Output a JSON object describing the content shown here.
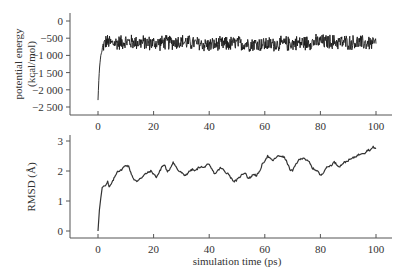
{
  "chart_data": [
    {
      "type": "line",
      "title": "",
      "xlabel": "",
      "ylabel": "potential energy (kcal/mol)",
      "ylabel_lines": [
        "potential energy",
        "(kcal/mol)"
      ],
      "xlim": [
        -10,
        105
      ],
      "ylim": [
        -2700,
        250
      ],
      "x_ticks": [
        0,
        20,
        40,
        60,
        80,
        100
      ],
      "x_tick_labels": [
        "0",
        "20",
        "40",
        "60",
        "80",
        "100"
      ],
      "y_ticks": [
        0,
        -500,
        -1000,
        -1500,
        -2000,
        -2500
      ],
      "y_tick_labels": [
        "0",
        "-500",
        "-1 000",
        "-1 500",
        "-2 000",
        "-2 500"
      ],
      "grid": false,
      "series": [
        {
          "name": "potential energy",
          "color": "#1a1a1a",
          "description": "Starts at about -2300 at t=0, rises sharply to about -700 by t=2 ps, then fluctuates noisily around -650 (range approx -1200 to -50) until 100 ps",
          "x": [
            0,
            0.3,
            0.6,
            1,
            1.5,
            2,
            3,
            5,
            10,
            20,
            30,
            40,
            50,
            60,
            70,
            80,
            90,
            100
          ],
          "values": [
            -2300,
            -1700,
            -1300,
            -1000,
            -850,
            -700,
            -600,
            -650,
            -600,
            -650,
            -600,
            -700,
            -650,
            -680,
            -650,
            -600,
            -620,
            -650
          ],
          "noise_amplitude": 250
        }
      ]
    },
    {
      "type": "line",
      "title": "",
      "xlabel": "simulation time (ps)",
      "ylabel": "RMSD (Å)",
      "xlim": [
        -10,
        105
      ],
      "ylim": [
        -0.25,
        3.2
      ],
      "x_ticks": [
        0,
        20,
        40,
        60,
        80,
        100
      ],
      "x_tick_labels": [
        "0",
        "20",
        "40",
        "60",
        "80",
        "100"
      ],
      "y_ticks": [
        0,
        1,
        2,
        3
      ],
      "y_tick_labels": [
        "0",
        "1",
        "2",
        "3"
      ],
      "grid": false,
      "series": [
        {
          "name": "RMSD",
          "color": "#333333",
          "x": [
            0,
            0.5,
            1,
            1.5,
            2,
            3,
            3.5,
            4,
            5,
            6,
            7,
            8,
            9,
            10,
            11,
            12,
            13,
            14,
            15,
            16,
            17,
            18,
            19,
            20,
            21,
            22,
            23,
            24,
            25,
            26,
            27,
            28,
            29,
            30,
            31,
            32,
            33,
            34,
            35,
            36,
            37,
            38,
            39,
            40,
            41,
            42,
            43,
            44,
            45,
            46,
            47,
            48,
            49,
            50,
            51,
            52,
            53,
            54,
            55,
            56,
            57,
            58,
            59,
            60,
            61,
            62,
            63,
            64,
            65,
            66,
            67,
            68,
            69,
            70,
            71,
            72,
            73,
            74,
            75,
            76,
            77,
            78,
            79,
            80,
            81,
            82,
            83,
            84,
            85,
            86,
            87,
            88,
            89,
            90,
            91,
            92,
            93,
            94,
            95,
            96,
            97,
            98,
            99,
            100
          ],
          "values": [
            0,
            0.7,
            1.1,
            1.45,
            1.5,
            1.55,
            1.65,
            1.45,
            1.6,
            1.8,
            2.0,
            2.0,
            2.1,
            2.2,
            2.15,
            1.9,
            1.7,
            1.65,
            1.75,
            1.8,
            1.9,
            1.95,
            2.0,
            1.9,
            1.8,
            1.95,
            2.15,
            2.2,
            1.95,
            2.1,
            2.3,
            2.15,
            2.0,
            1.95,
            1.85,
            1.9,
            2.0,
            2.05,
            2.0,
            2.1,
            2.15,
            2.1,
            2.2,
            2.2,
            2.05,
            1.9,
            2.0,
            2.1,
            2.05,
            1.95,
            1.9,
            1.75,
            1.65,
            1.7,
            1.8,
            1.9,
            1.95,
            1.75,
            1.8,
            1.9,
            1.85,
            1.95,
            2.2,
            2.35,
            2.5,
            2.4,
            2.35,
            2.45,
            2.5,
            2.5,
            2.45,
            2.3,
            2.05,
            2.0,
            2.2,
            2.35,
            2.4,
            2.45,
            2.35,
            2.3,
            2.1,
            2.05,
            2.0,
            1.85,
            1.95,
            2.1,
            2.15,
            2.2,
            2.3,
            2.2,
            2.15,
            2.25,
            2.3,
            2.35,
            2.4,
            2.45,
            2.5,
            2.55,
            2.6,
            2.6,
            2.7,
            2.7,
            2.8,
            2.75
          ]
        }
      ]
    }
  ]
}
